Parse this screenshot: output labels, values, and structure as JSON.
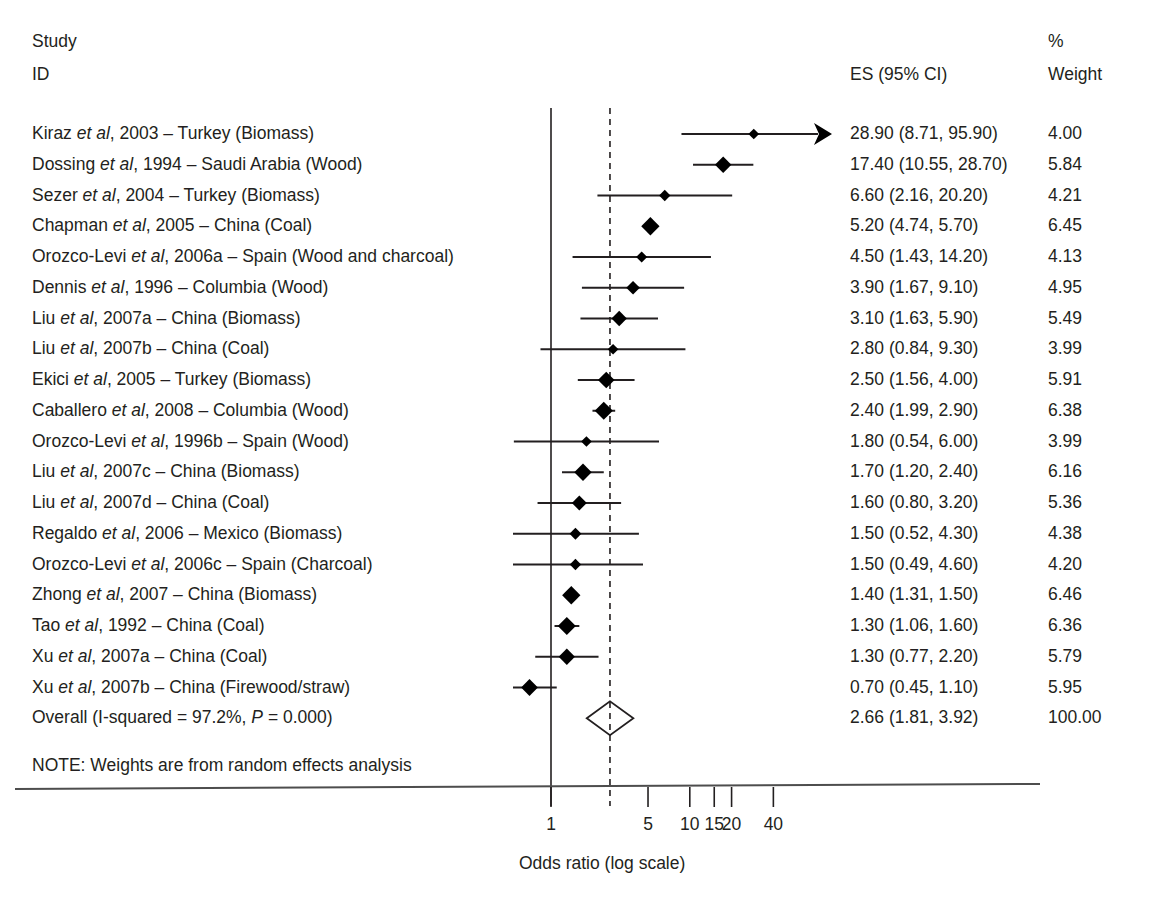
{
  "header": {
    "study_line1": "Study",
    "study_line2": "ID",
    "es_label": "ES (95% CI)",
    "weight_line1": "%",
    "weight_line2": "Weight"
  },
  "note": "NOTE: Weights are from random effects analysis",
  "axis": {
    "title": "Odds ratio (log scale)",
    "ticks": [
      "1",
      "5",
      "10",
      "15",
      "20",
      "40"
    ],
    "tick_values": [
      1,
      5,
      10,
      15,
      20,
      40
    ],
    "null_line_value": 1,
    "overall_line_value": 2.66,
    "scale": "log"
  },
  "colors": {
    "ink": "#231f20",
    "marker": "#000000",
    "rule": "#4d4d4d"
  },
  "chart_data": {
    "type": "forest",
    "title": "",
    "xlabel": "Odds ratio (log scale)",
    "ylabel": "",
    "xscale": "log",
    "xlim": [
      0.38,
      60
    ],
    "xticks": [
      1,
      5,
      10,
      15,
      20,
      40
    ],
    "xticklabels": [
      "1",
      "5",
      "10",
      "15",
      "20",
      "40"
    ],
    "reference_line": 1,
    "summary_line": 2.66,
    "columns": [
      "Study ID",
      "ES (95% CI)",
      "% Weight"
    ],
    "rows": [
      {
        "study": "Kiraz et al, 2003 – Turkey (Biomass)",
        "author": "Kiraz",
        "es": 28.9,
        "lo": 8.71,
        "hi": 95.9,
        "es_text": "28.90 (8.71, 95.90)",
        "weight": 4.0,
        "weight_text": "4.00",
        "clipped_right": true
      },
      {
        "study": "Dossing et al, 1994 – Saudi Arabia (Wood)",
        "author": "Dossing",
        "es": 17.4,
        "lo": 10.55,
        "hi": 28.7,
        "es_text": "17.40 (10.55, 28.70)",
        "weight": 5.84,
        "weight_text": "5.84",
        "clipped_right": false
      },
      {
        "study": "Sezer et al, 2004 – Turkey (Biomass)",
        "author": "Sezer",
        "es": 6.6,
        "lo": 2.16,
        "hi": 20.2,
        "es_text": "6.60 (2.16, 20.20)",
        "weight": 4.21,
        "weight_text": "4.21",
        "clipped_right": false
      },
      {
        "study": "Chapman et al, 2005 – China (Coal)",
        "author": "Chapman",
        "es": 5.2,
        "lo": 4.74,
        "hi": 5.7,
        "es_text": "5.20 (4.74, 5.70)",
        "weight": 6.45,
        "weight_text": "6.45",
        "clipped_right": false
      },
      {
        "study": "Orozco-Levi et al, 2006a – Spain (Wood and charcoal)",
        "author": "Orozco-Levi",
        "es": 4.5,
        "lo": 1.43,
        "hi": 14.2,
        "es_text": "4.50 (1.43, 14.20)",
        "weight": 4.13,
        "weight_text": "4.13",
        "clipped_right": false
      },
      {
        "study": "Dennis et al, 1996 – Columbia (Wood)",
        "author": "Dennis",
        "es": 3.9,
        "lo": 1.67,
        "hi": 9.1,
        "es_text": "3.90 (1.67, 9.10)",
        "weight": 4.95,
        "weight_text": "4.95",
        "clipped_right": false
      },
      {
        "study": "Liu et al, 2007a – China (Biomass)",
        "author": "Liu",
        "es": 3.1,
        "lo": 1.63,
        "hi": 5.9,
        "es_text": "3.10 (1.63, 5.90)",
        "weight": 5.49,
        "weight_text": "5.49",
        "clipped_right": false
      },
      {
        "study": "Liu et al, 2007b – China (Coal)",
        "author": "Liu",
        "es": 2.8,
        "lo": 0.84,
        "hi": 9.3,
        "es_text": "2.80 (0.84, 9.30)",
        "weight": 3.99,
        "weight_text": "3.99",
        "clipped_right": false
      },
      {
        "study": "Ekici et al, 2005 – Turkey (Biomass)",
        "author": "Ekici",
        "es": 2.5,
        "lo": 1.56,
        "hi": 4.0,
        "es_text": "2.50 (1.56, 4.00)",
        "weight": 5.91,
        "weight_text": "5.91",
        "clipped_right": false
      },
      {
        "study": "Caballero et al, 2008 – Columbia (Wood)",
        "author": "Caballero",
        "es": 2.4,
        "lo": 1.99,
        "hi": 2.9,
        "es_text": "2.40 (1.99, 2.90)",
        "weight": 6.38,
        "weight_text": "6.38",
        "clipped_right": false
      },
      {
        "study": "Orozco-Levi et al, 1996b – Spain (Wood)",
        "author": "Orozco-Levi",
        "es": 1.8,
        "lo": 0.54,
        "hi": 6.0,
        "es_text": "1.80 (0.54, 6.00)",
        "weight": 3.99,
        "weight_text": "3.99",
        "clipped_right": false
      },
      {
        "study": "Liu et al, 2007c – China (Biomass)",
        "author": "Liu",
        "es": 1.7,
        "lo": 1.2,
        "hi": 2.4,
        "es_text": "1.70 (1.20, 2.40)",
        "weight": 6.16,
        "weight_text": "6.16",
        "clipped_right": false
      },
      {
        "study": "Liu et al, 2007d – China (Coal)",
        "author": "Liu",
        "es": 1.6,
        "lo": 0.8,
        "hi": 3.2,
        "es_text": "1.60 (0.80, 3.20)",
        "weight": 5.36,
        "weight_text": "5.36",
        "clipped_right": false
      },
      {
        "study": "Regaldo et al, 2006 – Mexico (Biomass)",
        "author": "Regaldo",
        "es": 1.5,
        "lo": 0.52,
        "hi": 4.3,
        "es_text": "1.50 (0.52, 4.30)",
        "weight": 4.38,
        "weight_text": "4.38",
        "clipped_right": false
      },
      {
        "study": "Orozco-Levi et al, 2006c – Spain (Charcoal)",
        "author": "Orozco-Levi",
        "es": 1.5,
        "lo": 0.49,
        "hi": 4.6,
        "es_text": "1.50 (0.49, 4.60)",
        "weight": 4.2,
        "weight_text": "4.20",
        "clipped_right": false
      },
      {
        "study": "Zhong et al, 2007 – China (Biomass)",
        "author": "Zhong",
        "es": 1.4,
        "lo": 1.31,
        "hi": 1.5,
        "es_text": "1.40 (1.31, 1.50)",
        "weight": 6.46,
        "weight_text": "6.46",
        "clipped_right": false
      },
      {
        "study": "Tao et al, 1992 – China (Coal)",
        "author": "Tao",
        "es": 1.3,
        "lo": 1.06,
        "hi": 1.6,
        "es_text": "1.30 (1.06, 1.60)",
        "weight": 6.36,
        "weight_text": "6.36",
        "clipped_right": false
      },
      {
        "study": "Xu et al, 2007a – China (Coal)",
        "author": "Xu",
        "es": 1.3,
        "lo": 0.77,
        "hi": 2.2,
        "es_text": "1.30 (0.77, 2.20)",
        "weight": 5.79,
        "weight_text": "5.79",
        "clipped_right": false
      },
      {
        "study": "Xu et al, 2007b – China (Firewood/straw)",
        "author": "Xu",
        "es": 0.7,
        "lo": 0.45,
        "hi": 1.1,
        "es_text": "0.70 (0.45, 1.10)",
        "weight": 5.95,
        "weight_text": "5.95",
        "clipped_right": false
      }
    ],
    "overall": {
      "study": "Overall (I-squared = 97.2%, P = 0.000)",
      "es": 2.66,
      "lo": 1.81,
      "hi": 3.92,
      "es_text": "2.66 (1.81, 3.92)",
      "weight": 100.0,
      "weight_text": "100.00",
      "i_squared": "97.2%",
      "p_value": "0.000"
    }
  }
}
